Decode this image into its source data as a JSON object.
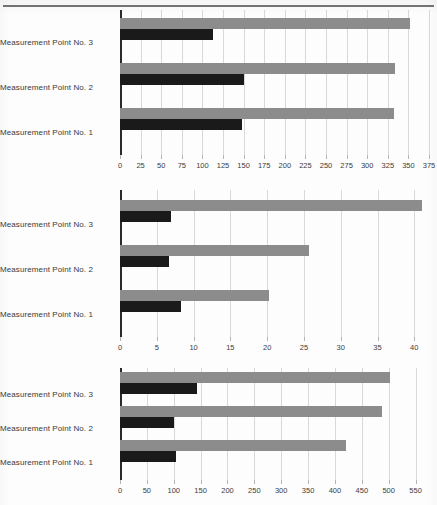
{
  "figure": {
    "background_color": "#fdfdfd",
    "series_colors": {
      "gray": "#8c8c8c",
      "black": "#1a1a1a"
    },
    "grid_color": "#d8d8d8",
    "axis_color": "#2b2b2b"
  },
  "chart_data": [
    {
      "type": "bar",
      "orientation": "horizontal",
      "title": "",
      "xlabel": "",
      "ylabel": "",
      "categories": [
        "Measurement Point No. 1",
        "Measurement Point No. 2",
        "Measurement Point No. 3"
      ],
      "series": [
        {
          "name": "gray",
          "color": "#8c8c8c",
          "values": [
            333,
            334,
            352
          ]
        },
        {
          "name": "black",
          "color": "#1a1a1a",
          "values": [
            148,
            151,
            113
          ]
        }
      ],
      "xlim": [
        0,
        375
      ],
      "xticks": [
        0,
        25,
        50,
        75,
        100,
        125,
        150,
        175,
        200,
        225,
        250,
        275,
        300,
        325,
        350,
        375
      ],
      "xtick_labels": [
        "0",
        "25",
        "50",
        "75",
        "100",
        "125",
        "150",
        "175",
        "200",
        "225",
        "250",
        "275",
        "300",
        "325",
        "350",
        "375"
      ],
      "grid": true,
      "legend": "none"
    },
    {
      "type": "bar",
      "orientation": "horizontal",
      "title": "",
      "xlabel": "",
      "ylabel": "",
      "categories": [
        "Measurement Point No. 1",
        "Measurement Point No. 2",
        "Measurement Point No. 3"
      ],
      "series": [
        {
          "name": "gray",
          "color": "#8c8c8c",
          "values": [
            20.2,
            25.7,
            41.0
          ]
        },
        {
          "name": "black",
          "color": "#1a1a1a",
          "values": [
            8.3,
            6.6,
            6.9
          ]
        }
      ],
      "xlim": [
        0,
        42
      ],
      "xticks": [
        0,
        5,
        10,
        15,
        20,
        25,
        30,
        35,
        40
      ],
      "xtick_labels": [
        "0",
        "5",
        "10",
        "15",
        "20",
        "25",
        "30",
        "35",
        "40"
      ],
      "grid": true,
      "legend": "none"
    },
    {
      "type": "bar",
      "orientation": "horizontal",
      "title": "",
      "xlabel": "",
      "ylabel": "",
      "categories": [
        "Measurement Point No. 1",
        "Measurement Point No. 2",
        "Measurement Point No. 3"
      ],
      "series": [
        {
          "name": "gray",
          "color": "#8c8c8c",
          "values": [
            420,
            488,
            503
          ]
        },
        {
          "name": "black",
          "color": "#1a1a1a",
          "values": [
            104,
            101,
            143
          ]
        }
      ],
      "xlim": [
        0,
        575
      ],
      "xticks": [
        0,
        50,
        100,
        150,
        200,
        250,
        300,
        350,
        400,
        450,
        500,
        550
      ],
      "xtick_labels": [
        "0",
        "50",
        "100",
        "150",
        "200",
        "250",
        "300",
        "350",
        "400",
        "450",
        "500",
        "550"
      ],
      "grid": true,
      "legend": "none"
    }
  ]
}
